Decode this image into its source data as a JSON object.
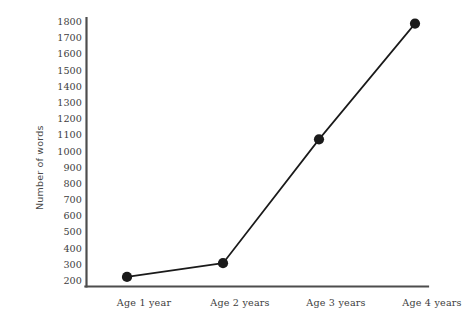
{
  "chart_data": {
    "type": "line",
    "title": "",
    "xlabel": "",
    "ylabel": "Number of words",
    "categories": [
      "Age 1 year",
      "Age 2 years",
      "Age 3 years",
      "Age 4 years"
    ],
    "values": [
      225,
      310,
      1075,
      1790
    ],
    "series": [
      {
        "name": "Number of words",
        "values": [
          225,
          310,
          1075,
          1790
        ]
      }
    ],
    "ylim": [
      200,
      1800
    ],
    "ytick_step": 100,
    "yticks": [
      1800,
      1700,
      1600,
      1500,
      1400,
      1300,
      1200,
      1100,
      1000,
      900,
      800,
      700,
      600,
      500,
      400,
      300,
      200
    ],
    "ytick_labels": [
      "1800",
      "1700",
      "1600",
      "1500",
      "1400",
      "1300",
      "1200",
      "1100",
      "1000",
      "900",
      "800",
      "700",
      "600",
      "500",
      "400",
      "300",
      "200"
    ],
    "grid": false,
    "legend": false,
    "legend_position": "none",
    "marker": "filled-circle",
    "line_color": "#1a1a1a",
    "marker_color": "#1a1a1a",
    "axis_color": "#4d4d4d",
    "background_color": "#ffffff"
  }
}
